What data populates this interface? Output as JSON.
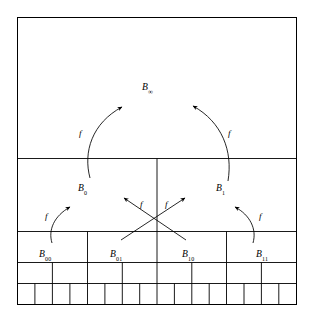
{
  "figure": {
    "background_color": "#ffffff",
    "line_color": "#000000",
    "width": 311,
    "height": 316
  },
  "nodes": [
    {
      "id": "B-infinity",
      "base": "B",
      "subscript": "∞",
      "x": 142,
      "y": 82,
      "level": 0
    },
    {
      "id": "B-0",
      "base": "B",
      "subscript": "0",
      "x": 78,
      "y": 183,
      "level": 1
    },
    {
      "id": "B-1",
      "base": "B",
      "subscript": "1",
      "x": 216,
      "y": 183,
      "level": 1
    },
    {
      "id": "B-00",
      "base": "B",
      "subscript": "00",
      "x": 39,
      "y": 249,
      "level": 2
    },
    {
      "id": "B-01",
      "base": "B",
      "subscript": "01",
      "x": 110,
      "y": 249,
      "level": 2
    },
    {
      "id": "B-10",
      "base": "B",
      "subscript": "10",
      "x": 182,
      "y": 249,
      "level": 2
    },
    {
      "id": "B-11",
      "base": "B",
      "subscript": "11",
      "x": 256,
      "y": 249,
      "level": 2
    }
  ],
  "map_labels": [
    {
      "id": "f-left-outer",
      "text": "f",
      "x": 79,
      "y": 129
    },
    {
      "id": "f-right-outer",
      "text": "f",
      "x": 228,
      "y": 129
    },
    {
      "id": "f-left-inner",
      "text": "f",
      "x": 45,
      "y": 212
    },
    {
      "id": "f-center-left",
      "text": "f",
      "x": 140,
      "y": 200
    },
    {
      "id": "f-center-right",
      "text": "f",
      "x": 165,
      "y": 200
    },
    {
      "id": "f-right-inner",
      "text": "f",
      "x": 259,
      "y": 212
    }
  ],
  "grid": {
    "outer_box": {
      "x": 17,
      "y": 17,
      "width": 280,
      "height": 288
    },
    "row_boundaries_y": [
      17,
      158,
      231,
      262,
      283,
      305
    ],
    "rows": [
      {
        "id": "row-level-0",
        "y_top": 17,
        "y_bottom": 158,
        "cells": 1,
        "label": "B-infinity region"
      },
      {
        "id": "row-level-1",
        "y_top": 158,
        "y_bottom": 231,
        "cells": 2,
        "label": "B-0 / B-1 region"
      },
      {
        "id": "row-level-2",
        "y_top": 231,
        "y_bottom": 262,
        "cells": 4,
        "label": "B-00 / B-01 / B-10 / B-11 region"
      },
      {
        "id": "row-level-3",
        "y_top": 262,
        "y_bottom": 283,
        "cells": 8,
        "label": "level 3 region"
      },
      {
        "id": "row-level-4",
        "y_top": 283,
        "y_bottom": 305,
        "cells": 16,
        "label": "level 4 region"
      }
    ]
  },
  "arrows": [
    {
      "id": "arrow-B0-to-Binfinity",
      "from": "B-0",
      "to": "B-infinity",
      "label": "f",
      "style": "curved"
    },
    {
      "id": "arrow-B1-to-Binfinity",
      "from": "B-1",
      "to": "B-infinity",
      "label": "f",
      "style": "curved"
    },
    {
      "id": "arrow-B00-to-B0",
      "from": "B-00",
      "to": "B-0",
      "label": "f",
      "style": "curved"
    },
    {
      "id": "arrow-B01-to-B1-cross",
      "from": "B-01",
      "to": "B-1",
      "label": "f",
      "style": "straight"
    },
    {
      "id": "arrow-B10-to-B0-cross",
      "from": "B-10",
      "to": "B-0",
      "label": "f",
      "style": "straight"
    },
    {
      "id": "arrow-B11-to-B1",
      "from": "B-11",
      "to": "B-1",
      "label": "f",
      "style": "curved"
    }
  ]
}
